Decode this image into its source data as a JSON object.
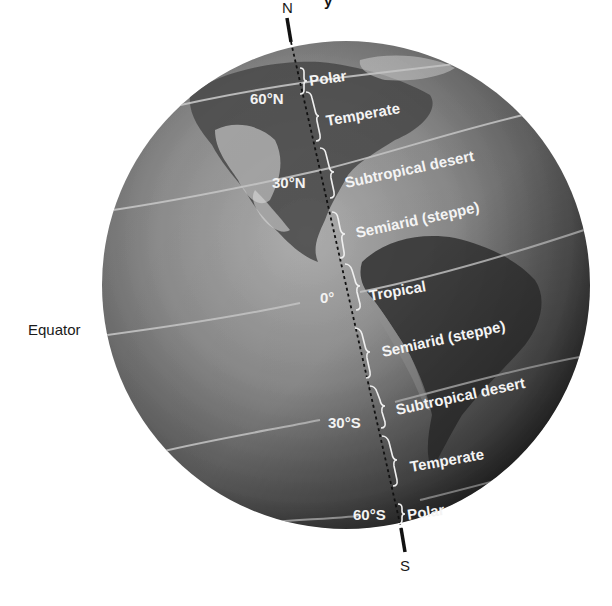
{
  "figure": {
    "title_fragment": "y",
    "pole_north": "N",
    "pole_south": "S",
    "equator_label": "Equator",
    "latitudes": {
      "n60": "60°N",
      "n30": "30°N",
      "eq": "0°",
      "s30": "30°S",
      "s60": "60°S"
    },
    "zones": [
      {
        "label": "Polar"
      },
      {
        "label": "Temperate"
      },
      {
        "label": "Subtropical desert"
      },
      {
        "label": "Semiarid (steppe)"
      },
      {
        "label": "Tropical"
      },
      {
        "label": "Semiarid (steppe)"
      },
      {
        "label": "Subtropical desert"
      },
      {
        "label": "Temperate"
      },
      {
        "label": "Polar"
      }
    ],
    "colors": {
      "globe_light": "#a8a8a8",
      "globe_mid": "#7a7a7a",
      "globe_dark": "#2a2a2a",
      "latitude_line": "#c8c8c8",
      "axis_line": "#111111",
      "label_text": "#f2f2f2",
      "land_dark": "#3a3a3a"
    }
  }
}
